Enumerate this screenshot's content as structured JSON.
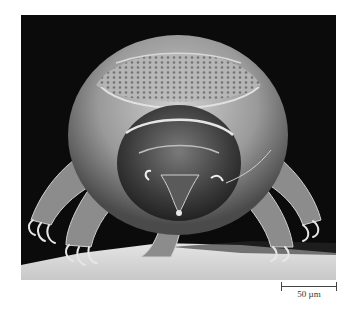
{
  "figure": {
    "background_color": "#0b0b0b",
    "surface_color": "#d8d8d8"
  },
  "scale_bar": {
    "label": "50 µm"
  }
}
